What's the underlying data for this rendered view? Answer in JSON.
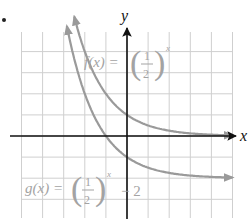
{
  "item_marker": "•",
  "chart_data": {
    "type": "line",
    "title": "",
    "xlabel": "x",
    "ylabel": "y",
    "xlim": [
      -5,
      5
    ],
    "ylim": [
      -4,
      5
    ],
    "grid": true,
    "grid_step": 1,
    "axis_ticks_labeled": false,
    "series": [
      {
        "name": "f(x) = (1/2)^x",
        "label_parts": {
          "lhs": "f(x) =",
          "num": "1",
          "den": "2",
          "exp": "x",
          "suffix": ""
        },
        "base": 0.5,
        "shift": 0,
        "x": [
          -2.5,
          -2,
          -1,
          0,
          1,
          2,
          3,
          4,
          5
        ],
        "values": [
          5.66,
          4,
          2,
          1,
          0.5,
          0.25,
          0.125,
          0.0625,
          0.03125
        ],
        "color": "#9a9a9a"
      },
      {
        "name": "g(x) = (1/2)^x - 2",
        "label_parts": {
          "lhs": "g(x) =",
          "num": "1",
          "den": "2",
          "exp": "x",
          "suffix": "− 2"
        },
        "base": 0.5,
        "shift": -2,
        "x": [
          -2.85,
          -2,
          -1,
          0,
          1,
          2,
          3,
          4,
          5
        ],
        "values": [
          5.21,
          2,
          0,
          -1,
          -1.5,
          -1.75,
          -1.875,
          -1.9375,
          -1.96875
        ],
        "color": "#9a9a9a"
      }
    ]
  },
  "colors": {
    "grid": "#cfcfcf",
    "axis": "#111111",
    "label": "#a3a3a3"
  }
}
